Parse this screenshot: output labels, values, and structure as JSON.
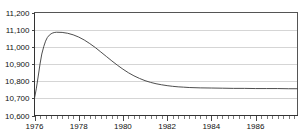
{
  "chart_data": {
    "type": "line",
    "title": "",
    "subtitle": "",
    "xlabel": "",
    "ylabel": "",
    "xlim": [
      1976,
      1987.9
    ],
    "ylim": [
      10600,
      11200
    ],
    "grid": true,
    "legend_position": "none",
    "y_ticks": [
      10600,
      10700,
      10800,
      10900,
      11000,
      11100,
      11200
    ],
    "y_tick_labels": [
      "10,600",
      "10,700",
      "10,800",
      "10,900",
      "11,000",
      "11,100",
      "11,200"
    ],
    "x_ticks": [
      1976,
      1978,
      1980,
      1982,
      1984,
      1986
    ],
    "x_tick_labels": [
      "1976",
      "1978",
      "1980",
      "1982",
      "1984",
      "1986"
    ],
    "x_minor_tick_step": 0.25,
    "series": [
      {
        "name": "series-1",
        "color": "#3a3a3a",
        "x": [
          1976.0,
          1976.08,
          1976.17,
          1976.25,
          1976.33,
          1976.42,
          1976.5,
          1976.58,
          1976.67,
          1976.75,
          1976.83,
          1976.92,
          1977.0,
          1977.25,
          1977.5,
          1977.75,
          1978.0,
          1978.25,
          1978.5,
          1978.75,
          1979.0,
          1979.25,
          1979.5,
          1979.75,
          1980.0,
          1980.25,
          1980.5,
          1980.75,
          1981.0,
          1981.25,
          1981.5,
          1981.75,
          1982.0,
          1982.25,
          1982.5,
          1982.75,
          1983.0,
          1983.5,
          1984.0,
          1984.5,
          1985.0,
          1985.5,
          1986.0,
          1986.5,
          1987.0,
          1987.5,
          1987.9
        ],
        "y": [
          10700,
          10755,
          10830,
          10900,
          10958,
          11002,
          11033,
          11054,
          11068,
          11076,
          11081,
          11084,
          11085,
          11084,
          11079,
          11070,
          11057,
          11040,
          11019,
          10996,
          10970,
          10944,
          10918,
          10893,
          10870,
          10849,
          10831,
          10816,
          10803,
          10793,
          10785,
          10779,
          10774,
          10770,
          10767,
          10765,
          10763,
          10761,
          10760,
          10759,
          10758,
          10758,
          10757,
          10757,
          10757,
          10756,
          10756
        ]
      }
    ]
  }
}
